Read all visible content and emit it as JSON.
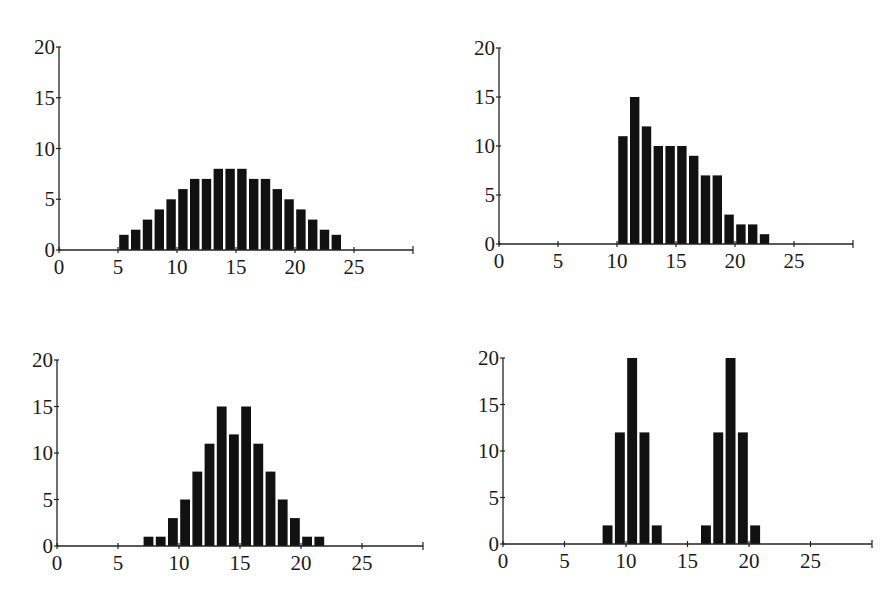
{
  "chart_data": [
    {
      "id": "top-left",
      "type": "bar",
      "title": "",
      "xlabel": "",
      "ylabel": "",
      "xlim": [
        0,
        30
      ],
      "ylim": [
        0,
        20
      ],
      "xticks": [
        0,
        5,
        10,
        15,
        20,
        25
      ],
      "yticks": [
        0,
        5,
        10,
        15,
        20
      ],
      "grid": false,
      "x": [
        5,
        6,
        7,
        8,
        9,
        10,
        11,
        12,
        13,
        14,
        15,
        16,
        17,
        18,
        19,
        20,
        21,
        22,
        23
      ],
      "values": [
        1.5,
        2,
        3,
        4,
        5,
        6,
        7,
        7,
        8,
        8,
        8,
        7,
        7,
        6,
        5,
        4,
        3,
        2,
        1.5
      ]
    },
    {
      "id": "top-right",
      "type": "bar",
      "title": "",
      "xlabel": "",
      "ylabel": "",
      "xlim": [
        0,
        30
      ],
      "ylim": [
        0,
        20
      ],
      "xticks": [
        0,
        5,
        10,
        15,
        20,
        25
      ],
      "yticks": [
        0,
        5,
        10,
        15,
        20
      ],
      "grid": false,
      "x": [
        10,
        11,
        12,
        13,
        14,
        15,
        16,
        17,
        18,
        19,
        20,
        21,
        22
      ],
      "values": [
        11,
        15,
        12,
        10,
        10,
        10,
        9,
        7,
        7,
        3,
        2,
        2,
        1
      ]
    },
    {
      "id": "bottom-left",
      "type": "bar",
      "title": "",
      "xlabel": "",
      "ylabel": "",
      "xlim": [
        0,
        30
      ],
      "ylim": [
        0,
        20
      ],
      "xticks": [
        0,
        5,
        10,
        15,
        20,
        25
      ],
      "yticks": [
        0,
        5,
        10,
        15,
        20
      ],
      "grid": false,
      "x": [
        7,
        8,
        9,
        10,
        11,
        12,
        13,
        14,
        15,
        16,
        17,
        18,
        19,
        20,
        21
      ],
      "values": [
        1,
        1,
        3,
        5,
        8,
        11,
        15,
        12,
        15,
        11,
        8,
        5,
        3,
        1,
        1
      ]
    },
    {
      "id": "bottom-right",
      "type": "bar",
      "title": "",
      "xlabel": "",
      "ylabel": "",
      "xlim": [
        0,
        30
      ],
      "ylim": [
        0,
        20
      ],
      "xticks": [
        0,
        5,
        10,
        15,
        20,
        25
      ],
      "yticks": [
        0,
        5,
        10,
        15,
        20
      ],
      "grid": false,
      "x": [
        8,
        9,
        10,
        11,
        12,
        16,
        17,
        18,
        19,
        20
      ],
      "values": [
        2,
        12,
        20,
        12,
        2,
        2,
        12,
        20,
        12,
        2
      ]
    }
  ],
  "layout": {
    "panels": [
      {
        "x0": 59,
        "y0": 250,
        "unit_x": 11.8,
        "unit_y": 10.15,
        "x_end": 30
      },
      {
        "x0": 499,
        "y0": 244,
        "unit_x": 11.8,
        "unit_y": 9.8,
        "x_end": 30
      },
      {
        "x0": 57,
        "y0": 546,
        "unit_x": 12.2,
        "unit_y": 9.3,
        "x_end": 30
      },
      {
        "x0": 503,
        "y0": 544,
        "unit_x": 12.3,
        "unit_y": 9.3,
        "x_end": 30
      }
    ],
    "bar_color": "#111111",
    "axis_color": "#222222"
  }
}
